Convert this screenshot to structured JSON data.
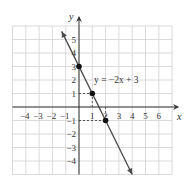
{
  "chart_data": {
    "type": "line",
    "title": "",
    "xlabel": "x",
    "ylabel": "y",
    "xlim": [
      -5,
      7
    ],
    "ylim": [
      -5,
      6
    ],
    "grid": true,
    "x_ticks": [
      "-4",
      "-3",
      "-2",
      "-1",
      "1",
      "2",
      "3",
      "4",
      "5",
      "6"
    ],
    "y_ticks": [
      "5",
      "4",
      "3",
      "2",
      "1",
      "-1",
      "-2",
      "-3",
      "-4"
    ],
    "series": [
      {
        "name": "y = -2x + 3",
        "equation": "y = −2x + 3",
        "slope": -2,
        "intercept": 3,
        "x": [
          -1.3,
          0,
          1,
          2,
          4.0
        ],
        "y": [
          5.6,
          3,
          1,
          -1,
          -5.0
        ]
      }
    ],
    "highlighted_points": [
      {
        "x": 0,
        "y": 3
      },
      {
        "x": 1,
        "y": 1
      },
      {
        "x": 2,
        "y": -1
      }
    ],
    "annotation": "y = −2x + 3"
  },
  "labels": {
    "x_axis": "x",
    "y_axis": "y",
    "equation": "y = −2x + 3"
  },
  "colors": {
    "grid": "#d0d0d0",
    "axis": "#333333",
    "line": "#4a4a4a",
    "point": "#111111"
  }
}
